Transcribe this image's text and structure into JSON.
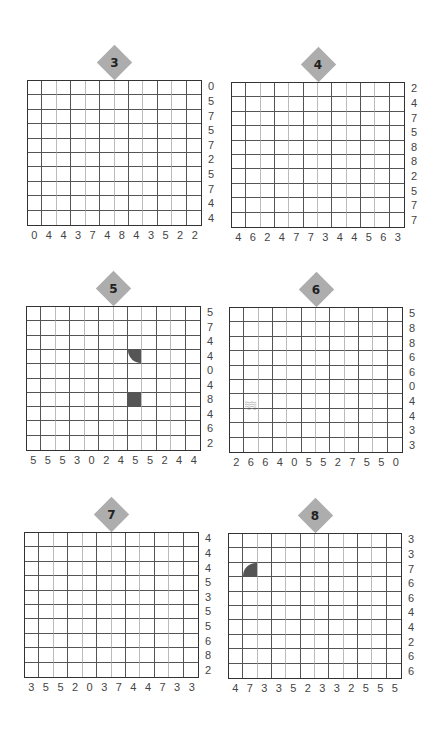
{
  "puzzles": [
    {
      "number": "3",
      "x": 27,
      "y": 80,
      "w": 175,
      "h": 146,
      "cols": 12,
      "rows": 10,
      "row_clues": [
        "0",
        "5",
        "7",
        "5",
        "7",
        "2",
        "5",
        "7",
        "4",
        "4"
      ],
      "col_clues": [
        "0",
        "4",
        "4",
        "3",
        "7",
        "4",
        "8",
        "4",
        "3",
        "5",
        "2",
        "2"
      ],
      "marks": []
    },
    {
      "number": "4",
      "x": 231,
      "y": 82,
      "w": 174,
      "h": 146,
      "cols": 12,
      "rows": 10,
      "row_clues": [
        "2",
        "4",
        "7",
        "5",
        "8",
        "8",
        "2",
        "5",
        "7",
        "7"
      ],
      "col_clues": [
        "4",
        "6",
        "2",
        "4",
        "7",
        "7",
        "3",
        "4",
        "4",
        "5",
        "6",
        "3"
      ],
      "marks": []
    },
    {
      "number": "5",
      "x": 26,
      "y": 306,
      "w": 175,
      "h": 145,
      "cols": 12,
      "rows": 10,
      "row_clues": [
        "5",
        "7",
        "4",
        "4",
        "0",
        "4",
        "8",
        "4",
        "6",
        "2"
      ],
      "col_clues": [
        "5",
        "5",
        "5",
        "3",
        "0",
        "2",
        "4",
        "5",
        "5",
        "2",
        "4",
        "4"
      ],
      "marks": [
        {
          "row": 3,
          "col": 7,
          "type": "quarter-circle",
          "rounded_corner": "bottom-left"
        },
        {
          "row": 6,
          "col": 7,
          "type": "square"
        }
      ]
    },
    {
      "number": "6",
      "x": 229,
      "y": 307,
      "w": 174,
      "h": 146,
      "cols": 12,
      "rows": 10,
      "row_clues": [
        "5",
        "8",
        "8",
        "6",
        "6",
        "0",
        "4",
        "4",
        "3",
        "3"
      ],
      "col_clues": [
        "2",
        "6",
        "6",
        "4",
        "0",
        "5",
        "5",
        "2",
        "7",
        "5",
        "5",
        "0"
      ],
      "marks": [
        {
          "row": 6,
          "col": 1,
          "type": "wave"
        }
      ]
    },
    {
      "number": "7",
      "x": 24,
      "y": 532,
      "w": 175,
      "h": 146,
      "cols": 12,
      "rows": 10,
      "row_clues": [
        "4",
        "4",
        "4",
        "5",
        "3",
        "5",
        "5",
        "6",
        "8",
        "2"
      ],
      "col_clues": [
        "3",
        "5",
        "5",
        "2",
        "0",
        "3",
        "7",
        "4",
        "4",
        "7",
        "3",
        "3"
      ],
      "marks": []
    },
    {
      "number": "8",
      "x": 228,
      "y": 533,
      "w": 174,
      "h": 146,
      "cols": 12,
      "rows": 10,
      "row_clues": [
        "3",
        "3",
        "7",
        "6",
        "6",
        "4",
        "4",
        "2",
        "6",
        "6"
      ],
      "col_clues": [
        "4",
        "7",
        "3",
        "3",
        "5",
        "2",
        "3",
        "3",
        "2",
        "5",
        "5",
        "5"
      ],
      "marks": [
        {
          "row": 2,
          "col": 1,
          "type": "quarter-circle",
          "rounded_corner": "top-left"
        }
      ]
    }
  ],
  "colors": {
    "badge": "#adadad",
    "mark": "#555555",
    "grid_line": "#555555"
  }
}
